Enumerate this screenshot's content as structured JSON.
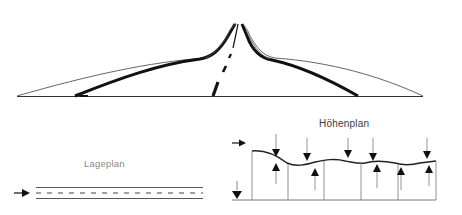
{
  "labels": {
    "lageplan": "Lageplan",
    "hoehenplan": "Höhenplan"
  },
  "panels": [
    {
      "name": "perspective-view",
      "description": "Road perspective with crests and dips, converging lane markings"
    },
    {
      "name": "lageplan",
      "description": "Plan view: straight road with dashed centerline, direction arrow"
    },
    {
      "name": "hoehenplan",
      "description": "Elevation profile: wavy grade line with crest/sag arrows and vertical stations"
    }
  ],
  "colors": {
    "ink": "#111111",
    "thin_line": "#555555",
    "label": "#4a4a4a"
  }
}
